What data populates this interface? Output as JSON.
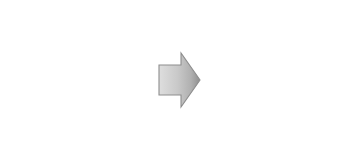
{
  "figure": {
    "width": 355,
    "height": 159,
    "background_color": "#ffffff"
  },
  "caption": {
    "text": "superposition"
  },
  "arrow": {
    "name": "right-arrow",
    "direction": "right",
    "fill_light": "#d8d8d8",
    "fill_dark": "#9a9a9a",
    "stroke": "#8a8a8a"
  },
  "cross": {
    "name": "cross-out-mark",
    "color": "#0d0d0d",
    "stroke_width": 2.4,
    "lines": [
      {
        "x1": 10,
        "y1": 8,
        "x2": 105,
        "y2": 103
      },
      {
        "x1": 105,
        "y1": 8,
        "x2": 8,
        "y2": 105
      }
    ]
  },
  "chart_data": [
    {
      "type": "scatter",
      "name": "input-wave-top",
      "title": "",
      "xlabel": "",
      "ylabel": "",
      "xlim": [
        0,
        142
      ],
      "ylim": [
        -1.6,
        1.6
      ],
      "grid": false,
      "legend": "none",
      "point_color": "#4a4a4a",
      "n_points": 2600,
      "waveform": {
        "form": "sine",
        "amplitude": 1.0,
        "cycles": 2.0,
        "phase_deg": 90,
        "noise_sigma": 0.34
      },
      "description": "noisy sinusoid, about two cycles, starts at a crest"
    },
    {
      "type": "scatter",
      "name": "input-wave-bottom",
      "title": "",
      "xlabel": "",
      "ylabel": "",
      "xlim": [
        0,
        142
      ],
      "ylim": [
        -1.6,
        1.6
      ],
      "grid": false,
      "legend": "none",
      "point_color": "#4a4a4a",
      "n_points": 2600,
      "waveform": {
        "form": "sine",
        "amplitude": 1.0,
        "cycles": 2.0,
        "phase_deg": 270,
        "noise_sigma": 0.34
      },
      "description": "noisy sinusoid, about two cycles, starts at a trough, inverted relative to the top wave"
    },
    {
      "type": "scatter",
      "name": "output-beat-pattern",
      "title": "",
      "xlabel": "",
      "ylabel": "",
      "xlim": [
        0,
        150
      ],
      "ylim": [
        -1.8,
        1.8
      ],
      "grid": false,
      "legend": "none",
      "point_color": "#4a4a4a",
      "n_points": 6000,
      "waveform": {
        "form": "beat",
        "envelope_lobes": 4,
        "carrier_cycles": 26,
        "amplitude": 1.0,
        "noise_sigma": 0.55
      },
      "description": "dense noisy interference / beat pattern with four lobes, each lobe has a lighter node at its centre"
    }
  ]
}
